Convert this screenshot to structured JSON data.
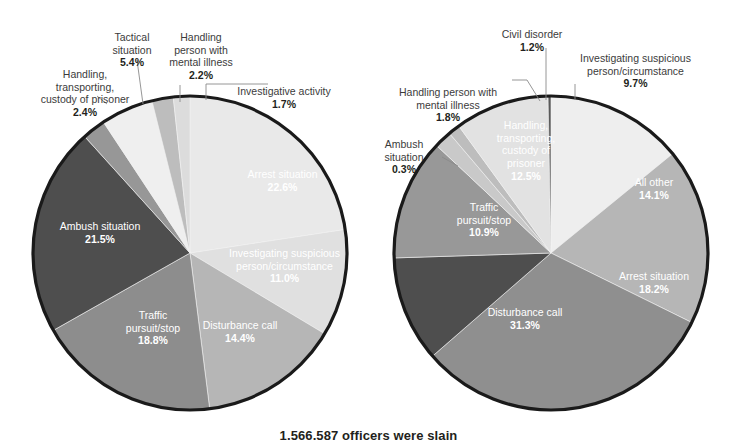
{
  "figure": {
    "background_color": "#ffffff",
    "caption_cut_off": "1,566,587 officers were slain",
    "text_color": "#3b3b3b",
    "pct_color": "#231f20",
    "leader_color": "#8a8a8a",
    "pie_outline_color": "#1a1a1a"
  },
  "palette": {
    "very_light": "#e9e9e9",
    "light": "#d9d9d9",
    "light2": "#efefef",
    "medium_light": "#c3c3c3",
    "medium": "#a9a9a9",
    "medium_dark": "#8d8d8d",
    "dark": "#6f6f6f",
    "darker": "#555555",
    "darkest": "#474747"
  },
  "chart_data": [
    {
      "type": "pie",
      "id": "left-pie",
      "title": "",
      "center": [
        190,
        253
      ],
      "radius": 157,
      "start_angle_deg": 0,
      "direction": "clockwise",
      "categories": [
        "Arrest situation",
        "Investigating suspicious person/circumstance",
        "Disturbance call",
        "Traffic pursuit/stop",
        "Ambush situation",
        "Handling, transporting, custody of prisoner",
        "Tactical situation",
        "Handling person with mental illness",
        "Investigative activity"
      ],
      "values": [
        22.6,
        11.0,
        14.4,
        18.8,
        21.5,
        2.4,
        5.4,
        2.2,
        1.7
      ],
      "value_labels": [
        "22.6%",
        "11.0%",
        "14.4%",
        "18.8%",
        "21.5%",
        "2.4%",
        "5.4%",
        "2.2%",
        "1.7%"
      ],
      "colors": [
        "#e9e9e9",
        "#e0e0e0",
        "#b6b6b6",
        "#8d8d8d",
        "#4e4e4e",
        "#979797",
        "#efefef",
        "#bdbdbd",
        "#dcdcdc"
      ],
      "label_placement": [
        "inside",
        "inside",
        "inside",
        "inside",
        "inside",
        "outside",
        "outside",
        "outside",
        "outside"
      ]
    },
    {
      "type": "pie",
      "id": "right-pie",
      "title": "",
      "center": [
        551,
        253
      ],
      "radius": 157,
      "start_angle_deg": 0,
      "direction": "clockwise",
      "categories": [
        "All other",
        "Arrest situation",
        "Disturbance call",
        "Traffic pursuit/stop",
        "Handling, transporting, custody of prisoner",
        "Handling person with mental illness",
        "Civil disorder",
        "Investigating suspicious person/circumstance",
        "Ambush situation"
      ],
      "values": [
        14.1,
        18.2,
        31.3,
        10.9,
        12.5,
        1.8,
        1.2,
        9.7,
        0.3
      ],
      "value_labels": [
        "14.1%",
        "18.2%",
        "31.3%",
        "10.9%",
        "12.5%",
        "1.8%",
        "1.2%",
        "9.7%",
        "0.3%"
      ],
      "colors": [
        "#eeeeee",
        "#b6b6b6",
        "#8f8f8f",
        "#4e4e4e",
        "#989898",
        "#c9c9c9",
        "#bdbdbd",
        "#e2e2e2",
        "#5a5a5a"
      ],
      "label_placement": [
        "inside",
        "inside",
        "inside",
        "inside",
        "inside",
        "outside",
        "outside",
        "outside",
        "outside"
      ]
    }
  ],
  "left_chart": {
    "inside_labels": [
      {
        "name": "arrest-situation",
        "text": "Arrest situation",
        "pct": "22.6%",
        "x": 215,
        "y": 178,
        "w": 135
      },
      {
        "name": "investigating",
        "text": "Investigating suspicious\nperson/circumstance",
        "pct": "11.0%",
        "x": 222,
        "y": 257,
        "w": 125
      },
      {
        "name": "disturbance-call",
        "text": "Disturbance call",
        "pct": "14.4%",
        "x": 190,
        "y": 329,
        "w": 100
      },
      {
        "name": "traffic-pursuit-stop",
        "text": "Traffic\npursuit/stop",
        "pct": "18.8%",
        "x": 107,
        "y": 319,
        "w": 92
      },
      {
        "name": "ambush-situation",
        "text": "Ambush situation",
        "pct": "21.5%",
        "x": 44,
        "y": 230,
        "w": 112
      }
    ],
    "outside_labels": [
      {
        "name": "handling-transporting-custody",
        "text": "Handling,\ntransporting,\ncustody of prisoner",
        "pct": "2.4%",
        "x": 24,
        "y": 56,
        "w": 122,
        "align": "center"
      },
      {
        "name": "tactical-situation",
        "text": "Tactical\nsituation",
        "pct": "5.4%",
        "x": 96,
        "y": 19,
        "w": 72,
        "align": "center"
      },
      {
        "name": "handling-person-mental-illness",
        "text": "Handling\nperson with\nmental illness",
        "pct": "2.2%",
        "x": 160,
        "y": 19,
        "w": 82,
        "align": "center"
      },
      {
        "name": "investigative-activity",
        "text": "Investigative activity",
        "pct": "1.7%",
        "x": 220,
        "y": 73,
        "w": 128,
        "align": "center"
      }
    ],
    "leaders": [
      {
        "name": "leader-handling-transporting",
        "points": "97,96 107,104"
      },
      {
        "name": "leader-tactical",
        "points": "137,60 143,104"
      },
      {
        "name": "leader-mental-illness",
        "points": "180,85 180,102"
      },
      {
        "name": "leader-investigative",
        "points": "206,100 206,84 268,84"
      }
    ]
  },
  "right_chart": {
    "inside_labels": [
      {
        "name": "all-other",
        "text": "All other",
        "pct": "14.1%",
        "x": 612,
        "y": 186,
        "w": 84
      },
      {
        "name": "arrest-situation",
        "text": "Arrest situation",
        "pct": "18.2%",
        "x": 602,
        "y": 280,
        "w": 104
      },
      {
        "name": "disturbance-call",
        "text": "Disturbance call",
        "pct": "31.3%",
        "x": 470,
        "y": 316,
        "w": 110
      },
      {
        "name": "traffic-pursuit-stop",
        "text": "Traffic\npursuit/stop",
        "pct": "10.9%",
        "x": 438,
        "y": 211,
        "w": 92
      },
      {
        "name": "handling-transporting-custody",
        "text": "Handling,\ntransporting,\ncustody of\nprisoner",
        "pct": "12.5%",
        "x": 485,
        "y": 129,
        "w": 82
      }
    ],
    "outside_labels": [
      {
        "name": "handling-person-mental-illness",
        "text": "Handling person with\nmental illness",
        "pct": "1.8%",
        "x": 386,
        "y": 74,
        "w": 124,
        "align": "center"
      },
      {
        "name": "civil-disorder",
        "text": "Civil disorder",
        "pct": "1.2%",
        "x": 486,
        "y": 16,
        "w": 92,
        "align": "center"
      },
      {
        "name": "investigating-suspicious",
        "text": "Investigating suspicious\nperson/circumstance",
        "pct": "9.7%",
        "x": 563,
        "y": 40,
        "w": 145,
        "align": "center"
      },
      {
        "name": "ambush-situation",
        "text": "Ambush\nsituation",
        "pct": "0.3%",
        "x": 368,
        "y": 126,
        "w": 72,
        "align": "center"
      }
    ],
    "leaders": [
      {
        "name": "leader-mental-illness",
        "points": "512,80 527,80 540,101"
      },
      {
        "name": "leader-civil-disorder",
        "points": "546,48 546,100"
      },
      {
        "name": "leader-investigating",
        "points": "575,100 575,84"
      },
      {
        "name": "leader-ambush",
        "points": "442,157 458,166"
      }
    ]
  }
}
